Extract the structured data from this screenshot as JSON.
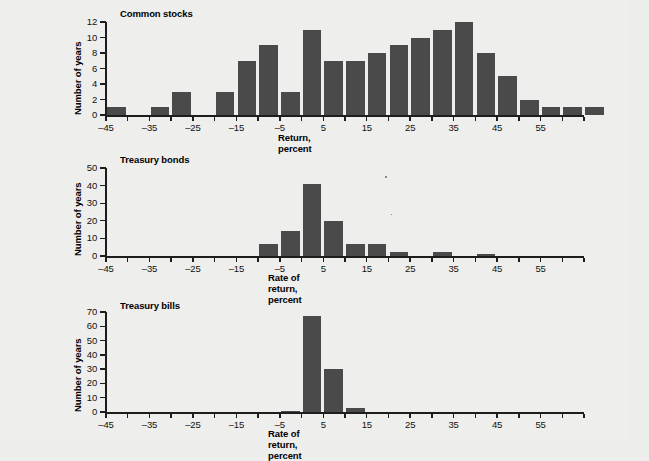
{
  "figure": {
    "background_color": "#ededeb",
    "bar_color": "#4a4a4a",
    "axis_color": "#1d1d1d"
  },
  "chart_data": [
    {
      "type": "bar",
      "title": "Common stocks",
      "xlabel": "Return, percent",
      "ylabel": "Number of years",
      "xlim": [
        -45,
        65
      ],
      "ylim": [
        0,
        12
      ],
      "ytick_labels": [
        "0",
        "2",
        "4",
        "6",
        "8",
        "10",
        "12"
      ],
      "ytick_values": [
        0,
        2,
        4,
        6,
        8,
        10,
        12
      ],
      "xtick_labels": [
        "-45",
        "-35",
        "-25",
        "-15",
        "-5",
        "5",
        "15",
        "25",
        "35",
        "45",
        "55"
      ],
      "xtick_values": [
        -45,
        -35,
        -25,
        -15,
        -5,
        5,
        15,
        25,
        35,
        45,
        55
      ],
      "xminor_step": 5,
      "bin_width": 5,
      "grid": false,
      "legend": "none",
      "bins": [
        -45,
        -40,
        -35,
        -30,
        -25,
        -20,
        -15,
        -10,
        -5,
        0,
        5,
        10,
        15,
        20,
        25,
        30,
        35,
        40,
        45,
        50,
        55,
        60
      ],
      "values": [
        1,
        0,
        1,
        3,
        0,
        3,
        7,
        9,
        3,
        11,
        7,
        7,
        8,
        9,
        10,
        11,
        12,
        8,
        5,
        2,
        1,
        1,
        1
      ]
    },
    {
      "type": "bar",
      "title": "Treasury bonds",
      "xlabel": "Rate of return, percent",
      "ylabel": "Number of years",
      "xlim": [
        -45,
        65
      ],
      "ylim": [
        0,
        50
      ],
      "ytick_labels": [
        "0",
        "10",
        "20",
        "30",
        "40",
        "50"
      ],
      "ytick_values": [
        0,
        10,
        20,
        30,
        40,
        50
      ],
      "xtick_labels": [
        "-45",
        "-35",
        "-25",
        "-15",
        "-5",
        "5",
        "15",
        "25",
        "35",
        "45",
        "55"
      ],
      "xtick_values": [
        -45,
        -35,
        -25,
        -15,
        -5,
        5,
        15,
        25,
        35,
        45,
        55
      ],
      "xminor_step": 5,
      "bin_width": 5,
      "grid": false,
      "legend": "none",
      "bins": [
        -45,
        -40,
        -35,
        -30,
        -25,
        -20,
        -15,
        -10,
        -5,
        0,
        5,
        10,
        15,
        20,
        25,
        30,
        35,
        40,
        45,
        50,
        55,
        60
      ],
      "values": [
        0,
        0,
        0,
        0,
        0,
        0,
        0,
        7,
        14,
        41,
        20,
        7,
        7,
        2,
        0,
        2,
        0,
        1,
        0,
        0,
        0,
        0
      ]
    },
    {
      "type": "bar",
      "title": "Treasury bills",
      "xlabel": "Rate of return, percent",
      "ylabel": "Number of years",
      "xlim": [
        -45,
        65
      ],
      "ylim": [
        0,
        70
      ],
      "ytick_labels": [
        "0",
        "10",
        "20",
        "30",
        "40",
        "50",
        "60",
        "70"
      ],
      "ytick_values": [
        0,
        10,
        20,
        30,
        40,
        50,
        60,
        70
      ],
      "xtick_labels": [
        "-45",
        "-35",
        "-25",
        "-15",
        "-5",
        "5",
        "15",
        "25",
        "35",
        "45",
        "55"
      ],
      "xtick_values": [
        -45,
        -35,
        -25,
        -15,
        -5,
        5,
        15,
        25,
        35,
        45,
        55
      ],
      "xminor_step": 5,
      "bin_width": 5,
      "grid": false,
      "legend": "none",
      "bins": [
        -45,
        -40,
        -35,
        -30,
        -25,
        -20,
        -15,
        -10,
        -5,
        0,
        5,
        10,
        15,
        20,
        25,
        30,
        35,
        40,
        45,
        50,
        55,
        60
      ],
      "values": [
        0,
        0,
        0,
        0,
        0,
        0,
        0,
        0,
        1,
        67,
        30,
        3,
        0,
        0,
        0,
        0,
        0,
        0,
        0,
        0,
        0,
        0
      ]
    }
  ]
}
